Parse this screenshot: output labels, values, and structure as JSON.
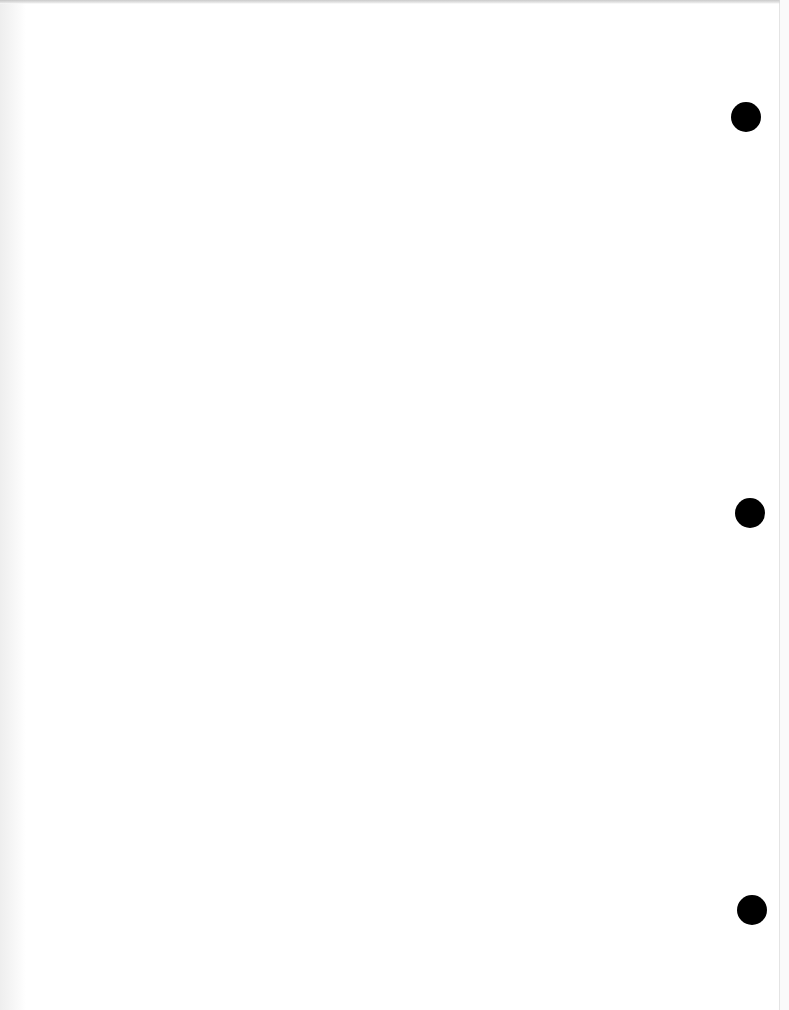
{
  "document": {
    "type": "blank scanned page",
    "background_color": "#ffffff",
    "text_content": "",
    "punch_holes": [
      {
        "cx": 746,
        "cy": 117,
        "diameter": 30,
        "color": "#000000"
      },
      {
        "cx": 750,
        "cy": 513,
        "diameter": 30,
        "color": "#000000"
      },
      {
        "cx": 752,
        "cy": 910,
        "diameter": 30,
        "color": "#000000"
      }
    ]
  }
}
